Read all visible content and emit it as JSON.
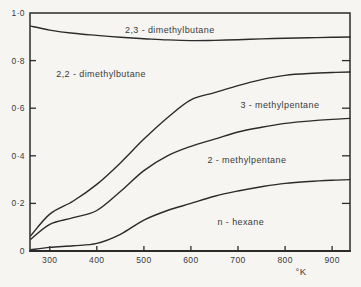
{
  "figure": {
    "background": "#f6f5f2",
    "ink": "#2b2b2b",
    "text_color": "#3a3a3a"
  },
  "chart_data": {
    "type": "line",
    "subtype": "stacked-equilibrium-composition-of-hexane-isomers",
    "title": "",
    "xlabel": "°K",
    "ylabel": "",
    "grid": false,
    "legend": "region labels inside plot",
    "xlim": [
      258,
      938
    ],
    "ylim": [
      0,
      1
    ],
    "x_ticks": [
      {
        "v": 300,
        "label": "300"
      },
      {
        "v": 400,
        "label": "400"
      },
      {
        "v": 500,
        "label": "500"
      },
      {
        "v": 600,
        "label": "600"
      },
      {
        "v": 700,
        "label": "700"
      },
      {
        "v": 800,
        "label": "800"
      },
      {
        "v": 900,
        "label": "900"
      }
    ],
    "y_ticks": [
      {
        "v": 1.0,
        "label": "1·0"
      },
      {
        "v": 0.8,
        "label": "0·8"
      },
      {
        "v": 0.6,
        "label": "0·6"
      },
      {
        "v": 0.4,
        "label": "0·4"
      },
      {
        "v": 0.2,
        "label": "0·2"
      },
      {
        "v": 0.0,
        "label": "0"
      }
    ],
    "x": [
      260,
      300,
      350,
      400,
      450,
      500,
      550,
      600,
      650,
      700,
      750,
      800,
      850,
      900,
      938
    ],
    "series": [
      {
        "name": "boundary-below-2,3-dimethylbutane-band",
        "values": [
          0.945,
          0.928,
          0.915,
          0.906,
          0.898,
          0.892,
          0.887,
          0.884,
          0.885,
          0.888,
          0.891,
          0.894,
          0.896,
          0.898,
          0.899
        ]
      },
      {
        "name": "boundary-below-2,2-dimethylbutane-band",
        "values": [
          0.065,
          0.155,
          0.21,
          0.28,
          0.37,
          0.47,
          0.56,
          0.635,
          0.665,
          0.695,
          0.72,
          0.738,
          0.746,
          0.75,
          0.752
        ]
      },
      {
        "name": "boundary-below-3-methylpentane-band",
        "values": [
          0.05,
          0.112,
          0.14,
          0.17,
          0.25,
          0.338,
          0.4,
          0.44,
          0.47,
          0.5,
          0.52,
          0.536,
          0.546,
          0.553,
          0.557
        ]
      },
      {
        "name": "boundary-below-2-methylpentane-band",
        "values": [
          0.005,
          0.015,
          0.022,
          0.032,
          0.07,
          0.13,
          0.17,
          0.2,
          0.23,
          0.252,
          0.27,
          0.284,
          0.292,
          0.297,
          0.3
        ]
      }
    ],
    "region_labels": [
      {
        "text": "2,3 - dimethylbutane",
        "T": 555,
        "v": 0.928
      },
      {
        "text": "2,2 - dimethylbutane",
        "T": 409,
        "v": 0.744
      },
      {
        "text": "3 - methylpentane",
        "T": 789,
        "v": 0.613
      },
      {
        "text": "2 - methylpentane",
        "T": 719,
        "v": 0.382
      },
      {
        "text": "n - hexane",
        "T": 706,
        "v": 0.122
      }
    ]
  }
}
